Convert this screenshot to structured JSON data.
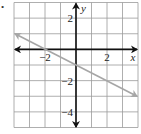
{
  "bullet": "•",
  "chart_data": {
    "type": "line",
    "title": "",
    "xlabel": "x",
    "ylabel": "y",
    "xlim": [
      -4,
      4
    ],
    "ylim": [
      -5,
      3
    ],
    "grid": true,
    "grid_step": 1,
    "x_ticks_labeled": [
      {
        "value": -2,
        "label": "−2"
      },
      {
        "value": 2,
        "label": "2"
      }
    ],
    "y_ticks_labeled": [
      {
        "value": 2,
        "label": "2"
      },
      {
        "value": -2,
        "label": "−2"
      },
      {
        "value": -4,
        "label": "−4"
      }
    ],
    "series": [
      {
        "name": "line",
        "equation": "y = -0.5x - 1",
        "slope": -0.5,
        "intercept": -1,
        "x": [
          -4,
          4
        ],
        "y": [
          1,
          -3
        ],
        "color": "#a6a6a6",
        "arrows_both_ends": true
      }
    ],
    "colors": {
      "axis": "#111111",
      "grid": "#9a9a9a",
      "line": "#a6a6a6"
    }
  }
}
